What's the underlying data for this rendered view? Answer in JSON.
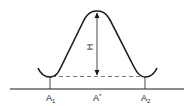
{
  "diagram": {
    "type": "energy-barrier",
    "colors": {
      "stroke": "#1a1a1a",
      "dashed": "#555555",
      "background": "#ffffff"
    },
    "height_label": "H",
    "labels": [
      {
        "id": "a1",
        "main": "A",
        "sub": "1"
      },
      {
        "id": "astar",
        "main": "A",
        "sup": "*"
      },
      {
        "id": "a2",
        "main": "A",
        "sub": "2"
      }
    ]
  }
}
